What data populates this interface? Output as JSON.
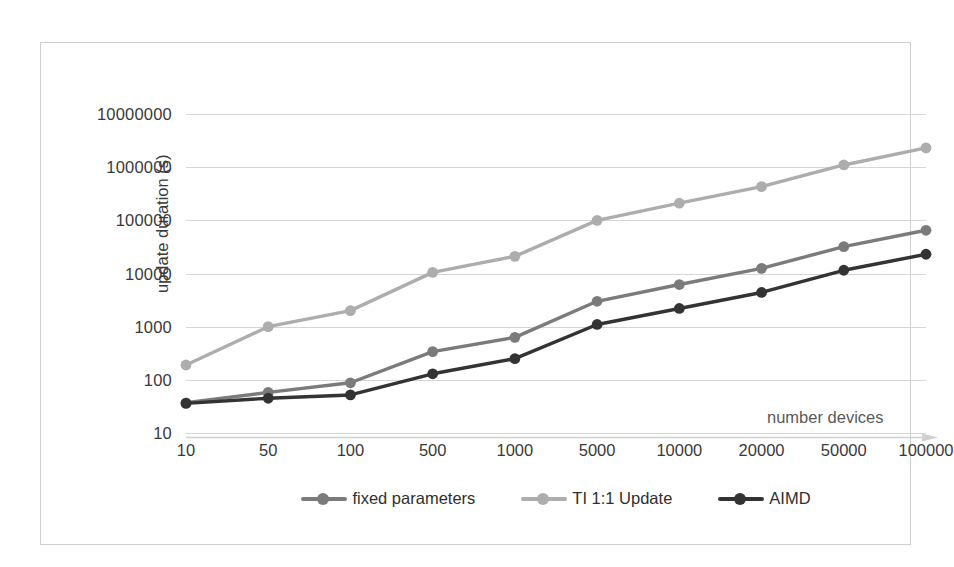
{
  "chart_data": {
    "type": "line",
    "title": "",
    "xlabel": "number devices",
    "ylabel": "update duration (s)",
    "yscale": "log",
    "ylim": [
      10,
      10000000
    ],
    "grid": true,
    "legend_position": "bottom",
    "categories": [
      "10",
      "50",
      "100",
      "500",
      "1000",
      "5000",
      "10000",
      "20000",
      "50000",
      "100000"
    ],
    "ytick_labels": [
      "10000000",
      "1000000",
      "100000",
      "10000",
      "1000",
      "100",
      "10"
    ],
    "ytick_values": [
      10000000,
      1000000,
      100000,
      10000,
      1000,
      100,
      10
    ],
    "series": [
      {
        "name": "fixed parameters",
        "color": "#7b7b7b",
        "values": [
          37,
          58,
          88,
          340,
          630,
          3000,
          6200,
          12500,
          32000,
          65000
        ]
      },
      {
        "name": "TI 1:1 Update",
        "color": "#adadad",
        "values": [
          190,
          1000,
          2000,
          10500,
          21000,
          100000,
          210000,
          430000,
          1100000,
          2300000
        ]
      },
      {
        "name": "AIMD",
        "color": "#333333",
        "values": [
          36,
          45,
          52,
          130,
          250,
          1100,
          2200,
          4400,
          11500,
          23000
        ]
      }
    ]
  },
  "axis": {
    "x_title": "number devices",
    "y_title": "update duration (s)"
  },
  "colors": {
    "fixed_parameters": "#7b7b7b",
    "ti_update": "#adadad",
    "aimd": "#333333",
    "gridline": "#d5d5d5",
    "frame": "#cfcfcf"
  },
  "legend": {
    "items": [
      {
        "label": "fixed parameters",
        "color": "#7b7b7b"
      },
      {
        "label": "TI 1:1 Update",
        "color": "#adadad"
      },
      {
        "label": "AIMD",
        "color": "#333333"
      }
    ]
  }
}
